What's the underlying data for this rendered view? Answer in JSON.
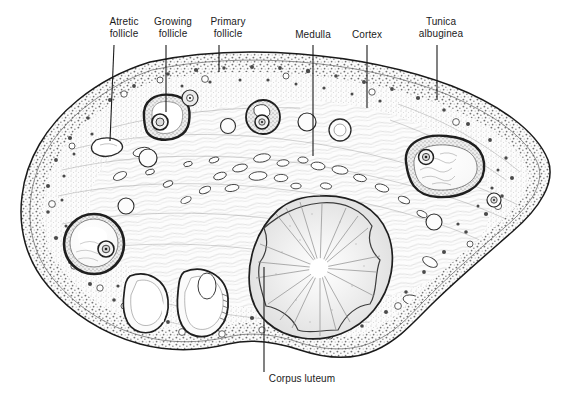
{
  "figure": {
    "kind": "histology-illustration",
    "background_color": "#ffffff",
    "ink_color": "#1b1b1b",
    "stipple_color": "#6e6e6e",
    "tissue_fill": "#fbfbfb"
  },
  "labels": [
    {
      "id": "atretic-follicle",
      "text": "Atretic\nfollicle",
      "text_x": 124,
      "text_y": 16,
      "line": {
        "x1": 114,
        "y1": 45,
        "x2": 110,
        "y2": 141
      }
    },
    {
      "id": "growing-follicle",
      "text": "Growing\nfollicle",
      "text_x": 173,
      "text_y": 16,
      "line": {
        "x1": 166,
        "y1": 45,
        "x2": 166,
        "y2": 112
      }
    },
    {
      "id": "primary-follicle",
      "text": "Primary\nfollicle",
      "text_x": 228,
      "text_y": 16,
      "line": {
        "x1": 219,
        "y1": 45,
        "x2": 219,
        "y2": 72
      }
    },
    {
      "id": "medulla",
      "text": "Medulla",
      "text_x": 313,
      "text_y": 29,
      "line": {
        "x1": 313,
        "y1": 45,
        "x2": 313,
        "y2": 156
      }
    },
    {
      "id": "cortex",
      "text": "Cortex",
      "text_x": 367,
      "text_y": 29,
      "line": {
        "x1": 367,
        "y1": 45,
        "x2": 367,
        "y2": 108
      }
    },
    {
      "id": "tunica-albuginea",
      "text": "Tunica\nalbuginea",
      "text_x": 441,
      "text_y": 16,
      "line": {
        "x1": 437,
        "y1": 45,
        "x2": 437,
        "y2": 100
      }
    },
    {
      "id": "corpus-luteum",
      "text": "Corpus luteum",
      "text_x": 302,
      "text_y": 378,
      "line": {
        "x1": 264,
        "y1": 267,
        "x2": 264,
        "y2": 372
      }
    }
  ],
  "structures": {
    "ovary_outline_note": "Large kidney/ovoid sectioned ovary filling the frame",
    "corpus_luteum": {
      "cx": 320,
      "cy": 268,
      "rx": 68,
      "ry": 72,
      "feature": "radiating folded wall"
    },
    "antral_follicles": [
      {
        "id": "follicle-right-large",
        "cx": 443,
        "cy": 167,
        "rx": 40,
        "ry": 29
      },
      {
        "id": "follicle-left-large",
        "cx": 94,
        "cy": 244,
        "rx": 30,
        "ry": 28
      },
      {
        "id": "follicle-growing",
        "cx": 166,
        "cy": 117,
        "rx": 23,
        "ry": 22
      }
    ],
    "primary_follicles": [
      {
        "id": "primary-1",
        "cx": 263,
        "cy": 117,
        "r": 16
      },
      {
        "id": "primary-2",
        "cx": 190,
        "cy": 97,
        "r": 7
      },
      {
        "id": "primary-3",
        "cx": 307,
        "cy": 122,
        "r": 8
      },
      {
        "id": "primary-4",
        "cx": 340,
        "cy": 128,
        "r": 10
      },
      {
        "id": "primary-5",
        "cx": 494,
        "cy": 200,
        "r": 7
      }
    ],
    "atretic_bodies": [
      {
        "id": "atretic-1",
        "cx": 108,
        "cy": 147,
        "rx": 13,
        "ry": 9
      },
      {
        "id": "corpus-albicans-1",
        "cx": 148,
        "cy": 300,
        "rx": 20,
        "ry": 30
      },
      {
        "id": "corpus-albicans-2",
        "cx": 204,
        "cy": 298,
        "rx": 22,
        "ry": 32
      }
    ],
    "medulla_vessels_count": 24
  }
}
